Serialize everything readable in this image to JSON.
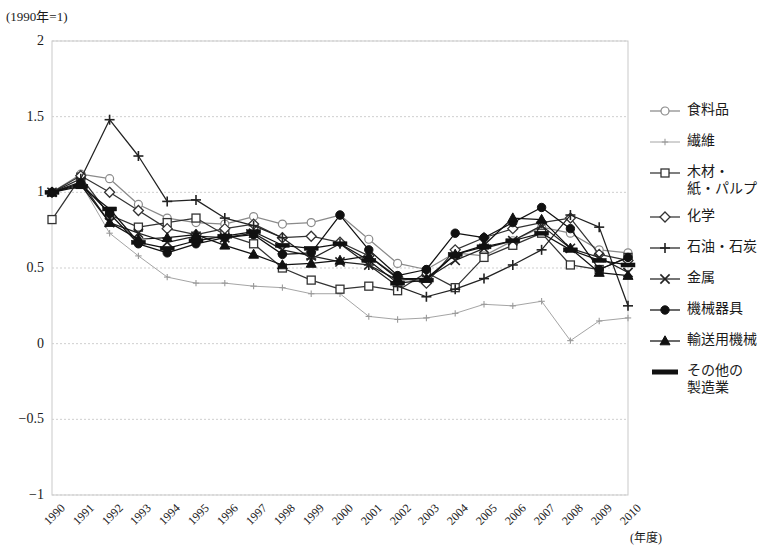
{
  "axis_unit_note": "(1990年=1)",
  "xaxis_unit": "(年度)",
  "yticks": [
    "2",
    "1.5",
    "1",
    "0.5",
    "0",
    "−0.5",
    "−1"
  ],
  "legend": {
    "items": [
      {
        "label": "食料品",
        "marker": "open-circle",
        "color": "#8a8a8a"
      },
      {
        "label": "繊維",
        "marker": "small-plus",
        "color": "#9a9a9a"
      },
      {
        "label": "木材・\n紙・パルプ",
        "marker": "open-square",
        "color": "#333333"
      },
      {
        "label": "化学",
        "marker": "open-diamond",
        "color": "#333333"
      },
      {
        "label": "石油・石炭",
        "marker": "plus",
        "color": "#222222"
      },
      {
        "label": "金属",
        "marker": "cross",
        "color": "#222222"
      },
      {
        "label": "機械器具",
        "marker": "filled-circle",
        "color": "#111111"
      },
      {
        "label": "輸送用機械",
        "marker": "filled-triangle",
        "color": "#111111"
      },
      {
        "label": "その他の\n製造業",
        "marker": "thick-line",
        "color": "#111111"
      }
    ]
  },
  "chart_data": {
    "type": "line",
    "title": "",
    "subtitle": "",
    "xlabel": "(年度)",
    "ylabel": "(1990年=1)",
    "grid": true,
    "legend_position": "right",
    "ylim": [
      -1,
      2
    ],
    "ytick_values": [
      2,
      1.5,
      1,
      0.5,
      0,
      -0.5,
      -1
    ],
    "categories": [
      "1990",
      "1991",
      "1992",
      "1993",
      "1994",
      "1995",
      "1996",
      "1997",
      "1998",
      "1999",
      "2000",
      "2001",
      "2002",
      "2003",
      "2004",
      "2005",
      "2006",
      "2007",
      "2008",
      "2009",
      "2010"
    ],
    "series": [
      {
        "name": "食料品",
        "marker": "open-circle",
        "color": "#8a8a8a",
        "values": [
          1.0,
          1.12,
          1.09,
          0.92,
          0.83,
          0.8,
          0.79,
          0.84,
          0.79,
          0.8,
          0.85,
          0.69,
          0.53,
          0.49,
          0.6,
          0.58,
          0.68,
          0.77,
          0.73,
          0.62,
          0.6
        ]
      },
      {
        "name": "繊維",
        "marker": "small-plus",
        "color": "#9a9a9a",
        "values": [
          1.0,
          1.06,
          0.73,
          0.58,
          0.44,
          0.4,
          0.4,
          0.38,
          0.37,
          0.33,
          0.33,
          0.18,
          0.16,
          0.17,
          0.2,
          0.26,
          0.25,
          0.28,
          0.02,
          0.15,
          0.17
        ]
      },
      {
        "name": "木材・\n紙・パルプ",
        "marker": "open-square",
        "color": "#333333",
        "values": [
          0.82,
          1.1,
          0.85,
          0.77,
          0.8,
          0.83,
          0.72,
          0.66,
          0.5,
          0.42,
          0.36,
          0.38,
          0.35,
          0.47,
          0.37,
          0.57,
          0.65,
          0.73,
          0.52,
          0.49,
          0.57
        ]
      },
      {
        "name": "化学",
        "marker": "open-diamond",
        "color": "#333333",
        "values": [
          1.0,
          1.11,
          1.0,
          0.88,
          0.76,
          0.72,
          0.76,
          0.79,
          0.7,
          0.71,
          0.67,
          0.58,
          0.44,
          0.4,
          0.62,
          0.7,
          0.76,
          0.8,
          0.83,
          0.59,
          0.55
        ]
      },
      {
        "name": "石油・石炭",
        "marker": "plus",
        "color": "#222222",
        "values": [
          1.0,
          1.09,
          1.48,
          1.24,
          0.94,
          0.95,
          0.83,
          0.78,
          0.7,
          0.56,
          0.66,
          0.52,
          0.38,
          0.31,
          0.36,
          0.43,
          0.52,
          0.62,
          0.85,
          0.77,
          0.25
        ]
      },
      {
        "name": "金属",
        "marker": "cross",
        "color": "#222222",
        "values": [
          1.0,
          1.07,
          0.8,
          0.73,
          0.67,
          0.71,
          0.7,
          0.73,
          0.62,
          0.58,
          0.54,
          0.52,
          0.42,
          0.43,
          0.55,
          0.63,
          0.68,
          0.78,
          0.63,
          0.57,
          0.47
        ]
      },
      {
        "name": "機械器具",
        "marker": "filled-circle",
        "color": "#111111",
        "values": [
          1.0,
          1.06,
          0.86,
          0.66,
          0.6,
          0.66,
          0.7,
          0.72,
          0.59,
          0.6,
          0.85,
          0.62,
          0.45,
          0.49,
          0.73,
          0.7,
          0.8,
          0.9,
          0.76,
          0.49,
          0.57
        ]
      },
      {
        "name": "輸送用機械",
        "marker": "filled-triangle",
        "color": "#111111",
        "values": [
          1.0,
          1.05,
          0.8,
          0.69,
          0.7,
          0.72,
          0.65,
          0.59,
          0.52,
          0.53,
          0.55,
          0.58,
          0.43,
          0.43,
          0.59,
          0.65,
          0.83,
          0.82,
          0.63,
          0.47,
          0.45
        ]
      },
      {
        "name": "その他の\n製造業",
        "marker": "thick-line",
        "color": "#111111",
        "values": [
          1.0,
          1.04,
          0.89,
          0.67,
          0.63,
          0.68,
          0.71,
          0.74,
          0.65,
          0.63,
          0.66,
          0.55,
          0.4,
          0.42,
          0.59,
          0.64,
          0.68,
          0.73,
          0.62,
          0.55,
          0.52
        ]
      }
    ]
  }
}
